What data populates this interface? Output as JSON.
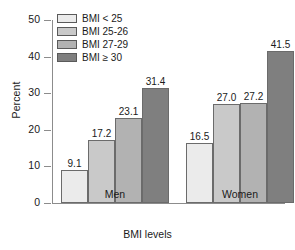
{
  "chart_data": {
    "type": "bar",
    "title": "",
    "xlabel": "BMI levels",
    "ylabel": "Percent",
    "categories": [
      "Men",
      "Women"
    ],
    "ylim": [
      0,
      50
    ],
    "yticks": [
      0,
      10,
      20,
      30,
      40,
      50
    ],
    "ytick_labels": [
      "0",
      "10",
      "20",
      "30",
      "40",
      "50"
    ],
    "grid": false,
    "legend_position": "top-left",
    "series": [
      {
        "name": "BMI < 25",
        "color": "#ebebeb",
        "values": [
          9.1,
          16.5
        ],
        "labels": [
          "9.1",
          "16.5"
        ]
      },
      {
        "name": "BMI 25-26",
        "color": "#c9c9c9",
        "values": [
          17.2,
          27.0
        ],
        "labels": [
          "17.2",
          "27.0"
        ]
      },
      {
        "name": "BMI 27-29",
        "color": "#b2b2b2",
        "values": [
          23.1,
          27.2
        ],
        "labels": [
          "23.1",
          "27.2"
        ]
      },
      {
        "name": "BMI ≥ 30",
        "color": "#7f7f7f",
        "values": [
          31.4,
          41.5
        ],
        "labels": [
          "31.4",
          "41.5"
        ]
      }
    ]
  },
  "axis": {
    "line_color": "#8c8c8c",
    "bar_border_color": "#6b6b6b"
  }
}
